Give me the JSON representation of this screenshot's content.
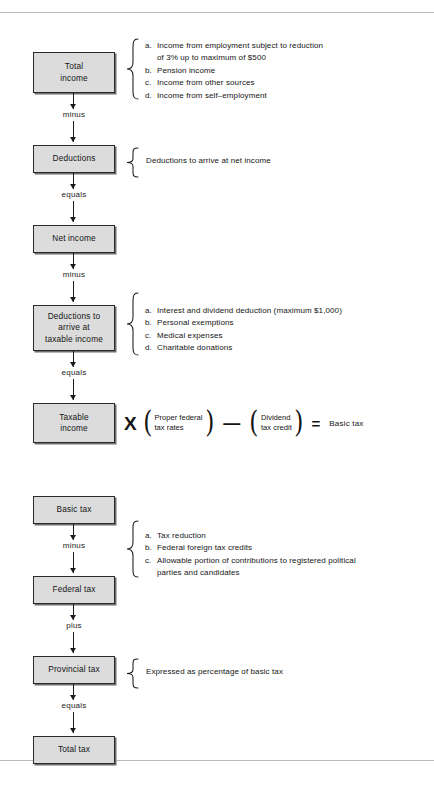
{
  "document": {
    "title": "Personal income tax computation flow chart",
    "rules": {
      "top": true,
      "bottom": true
    },
    "colors": {
      "box_fill": "#dcdcdc",
      "box_border": "#2b2b2b",
      "box_shadow": "#6e6e6e",
      "line": "#1b1b1b",
      "rule": "#b9b9b9",
      "text": "#141414"
    }
  },
  "section_one": {
    "boxes": [
      {
        "id": "total-income",
        "lines": [
          "Total",
          "income"
        ]
      },
      {
        "id": "deductions",
        "lines": [
          "Deductions"
        ]
      },
      {
        "id": "net-income",
        "lines": [
          "Net  income"
        ]
      },
      {
        "id": "deductions-taxable",
        "lines": [
          "Deductions to",
          "arrive at",
          "taxable income"
        ]
      },
      {
        "id": "taxable-income",
        "lines": [
          "Taxable",
          "income"
        ]
      }
    ],
    "operators": [
      {
        "id": "op-minus-1",
        "label": "minus"
      },
      {
        "id": "op-equals-1",
        "label": "equals"
      },
      {
        "id": "op-minus-2",
        "label": "minus"
      },
      {
        "id": "op-equals-2",
        "label": "equals"
      }
    ],
    "annotations": {
      "total_income": {
        "items": [
          {
            "marker": "a.",
            "text": "Income from employment subject to reduction",
            "continuation": "of 3% up to maximum of $500"
          },
          {
            "marker": "b.",
            "text": "Pension income"
          },
          {
            "marker": "c.",
            "text": "Income from other sources"
          },
          {
            "marker": "d.",
            "text": "Income from self–employment"
          }
        ]
      },
      "deductions": {
        "text": "Deductions to arrive at net income"
      },
      "deductions_taxable": {
        "items": [
          {
            "marker": "a.",
            "text": "Interest and dividend deduction (maximum $1,000)"
          },
          {
            "marker": "b.",
            "text": "Personal exemptions"
          },
          {
            "marker": "c.",
            "text": "Medical expenses"
          },
          {
            "marker": "d.",
            "text": "Charitable donations"
          }
        ]
      }
    },
    "equation": {
      "times_symbol": "X",
      "factor": {
        "line1": "Proper federal",
        "line2": "tax rates"
      },
      "minus_symbol": "—",
      "subtrahend": {
        "line1": "Dividend",
        "line2": "tax credit"
      },
      "equals_symbol": "=",
      "result": "Basic tax"
    }
  },
  "section_two": {
    "boxes": [
      {
        "id": "basic-tax",
        "lines": [
          "Basic tax"
        ]
      },
      {
        "id": "federal-tax",
        "lines": [
          "Federal tax"
        ]
      },
      {
        "id": "provincial-tax",
        "lines": [
          "Provincial tax"
        ]
      },
      {
        "id": "total-tax",
        "lines": [
          "Total  tax"
        ]
      }
    ],
    "operators": [
      {
        "id": "op-minus-3",
        "label": "minus"
      },
      {
        "id": "op-plus-1",
        "label": "plus"
      },
      {
        "id": "op-equals-3",
        "label": "equals"
      }
    ],
    "annotations": {
      "basic_tax": {
        "items": [
          {
            "marker": "a.",
            "text": "Tax reduction"
          },
          {
            "marker": "b.",
            "text": "Federal foreign tax credits"
          },
          {
            "marker": "c.",
            "text": "Allowable portion of contributions to registered political",
            "continuation": "parties and candidates"
          }
        ]
      },
      "provincial_tax": {
        "text": "Expressed as percentage of basic tax"
      }
    }
  }
}
